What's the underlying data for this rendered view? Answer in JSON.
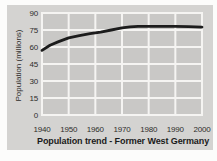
{
  "page": {
    "background": "#fcfcfb"
  },
  "card": {
    "background": "#d4d3d1"
  },
  "chart_data": {
    "type": "line",
    "title": "Population trend - Former West Germany",
    "ylabel": "Population (millions)",
    "xlabel": "",
    "x_ticks": [
      1940,
      1950,
      1960,
      1970,
      1980,
      1990,
      2000
    ],
    "y_ticks": [
      0,
      15,
      30,
      45,
      60,
      75,
      90
    ],
    "xlim": [
      1940,
      2000
    ],
    "ylim": [
      0,
      90
    ],
    "grid": true,
    "legend_position": "none",
    "plot_bg": "#c9c8c6",
    "grid_color": "#f5f4f2",
    "line_color": "#1c1c1c",
    "values_by_decade": [
      57,
      68,
      72.5,
      76.5,
      78,
      78,
      77.5
    ],
    "series": [
      {
        "name": "Population (millions)",
        "x": [
          1940,
          1943,
          1946,
          1950,
          1954,
          1958,
          1962,
          1966,
          1970,
          1973,
          1976,
          1980,
          1985,
          1990,
          1995,
          2000
        ],
        "y": [
          57,
          61.5,
          64.5,
          68,
          70,
          71.8,
          73.2,
          75,
          76.8,
          77.8,
          78.2,
          78.2,
          78.2,
          78.2,
          78,
          77.6
        ]
      }
    ]
  }
}
